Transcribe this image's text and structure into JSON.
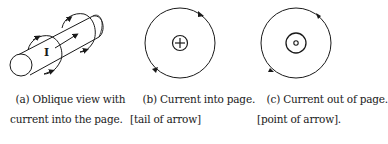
{
  "figure": {
    "stroke_color": "#1a1a1a",
    "background": "#ffffff",
    "panels": [
      {
        "id": "a",
        "label": "(a)",
        "caption_line1": "(a) Oblique view with",
        "caption_line2": "current into the page.",
        "current_label": "I",
        "depiction": "oblique cylinder (wire) with current arrow and circular magnetic field loops with arrowheads"
      },
      {
        "id": "b",
        "label": "(b)",
        "caption_line1": "(b) Current into page.",
        "caption_line2": "[tail of arrow]",
        "symbol": "circled-plus",
        "field_direction": "clockwise"
      },
      {
        "id": "c",
        "label": "(c)",
        "caption_line1": "(c) Current out of page.",
        "caption_line2": "[point of arrow].",
        "symbol": "circled-dot",
        "field_direction": "counterclockwise"
      }
    ]
  }
}
